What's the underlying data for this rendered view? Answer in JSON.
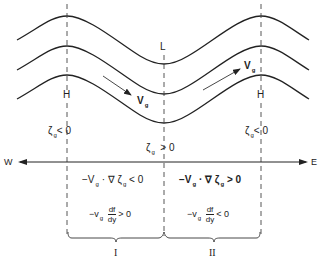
{
  "diagram": {
    "type": "Rossby wave / vorticity advection schematic",
    "colors": {
      "stroke": "#222222",
      "dash": "#444444",
      "background": "#ffffff"
    },
    "streamlines": {
      "count": 3
    },
    "pressure_labels": {
      "left_ridge": "H",
      "trough": "L",
      "right_ridge": "H"
    },
    "wind_labels": {
      "left": {
        "symbol": "V",
        "subscript": "g"
      },
      "right": {
        "symbol": "V",
        "subscript": "g"
      }
    },
    "vorticity_labels": {
      "left": {
        "symbol": "ζ",
        "subscript": "g",
        "relation": "< 0"
      },
      "center": {
        "symbol": "ζ",
        "subscript": "g",
        "relation": "> 0"
      },
      "right": {
        "symbol": "ζ",
        "subscript": "g",
        "relation": "< 0"
      }
    },
    "axis": {
      "west": "W",
      "east": "E"
    },
    "region_I": {
      "advection": {
        "prefix": "−V",
        "sub": "g",
        "mid": " · ∇ ζ",
        "sub2": "g",
        "relation": " < 0"
      },
      "beta": {
        "prefix": "−v",
        "sub": "g",
        "num": "df",
        "den": "dy",
        "relation": "> 0"
      },
      "label": "I"
    },
    "region_II": {
      "advection": {
        "prefix": "−V",
        "sub": "g",
        "mid": " · ∇ ζ",
        "sub2": "g",
        "relation": " > 0"
      },
      "beta": {
        "prefix": "−v",
        "sub": "g",
        "num": "df",
        "den": "dy",
        "relation": "< 0"
      },
      "label": "II"
    }
  }
}
